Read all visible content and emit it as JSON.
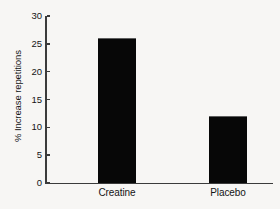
{
  "chart_data": {
    "type": "bar",
    "title": "",
    "xlabel": "",
    "ylabel": "% Increase repetitions",
    "categories": [
      "Creatine",
      "Placebo"
    ],
    "values": [
      26,
      12
    ],
    "ylim": [
      0,
      30
    ],
    "yticks": [
      0,
      5,
      10,
      15,
      20,
      25,
      30
    ],
    "ytick_labels": [
      "0",
      "5",
      "10",
      "15",
      "20",
      "25",
      "30"
    ],
    "grid": false,
    "legend": false,
    "bar_color": "#070707",
    "axis_color": "#3b3b3b",
    "background_color": "#f7f6f4"
  }
}
